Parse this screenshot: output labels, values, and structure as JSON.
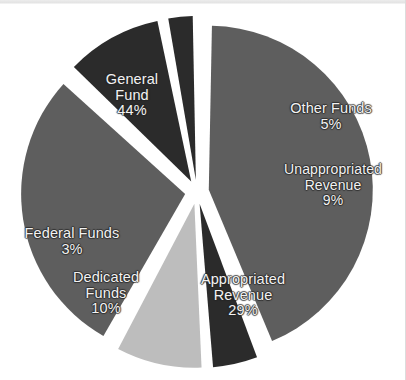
{
  "figure": {
    "kind": "pie-chart",
    "background_color": "#ffffff"
  },
  "chart_data": {
    "type": "pie",
    "title": "",
    "xlabel": "",
    "ylabel": "",
    "grid": false,
    "legend_position": "none",
    "label_style": "inside-slice",
    "exploded": true,
    "total_percent": 100,
    "categories": [
      "General Fund",
      "Other Funds",
      "Unappropriated Revenue",
      "Appropriated Revenue",
      "Dedicated Funds",
      "Federal Funds"
    ],
    "values": [
      44,
      5,
      9,
      29,
      10,
      3
    ],
    "slices": [
      {
        "name": "General Fund",
        "label_line1": "General",
        "label_line2": "Fund",
        "percent_label": "44%",
        "value": 44,
        "color": "#5e5e5e"
      },
      {
        "name": "Other Funds",
        "label_line1": "Other Funds",
        "label_line2": "",
        "percent_label": "5%",
        "value": 5,
        "color": "#2b2b2b"
      },
      {
        "name": "Unappropriated Revenue",
        "label_line1": "Unappropriated",
        "label_line2": "Revenue",
        "percent_label": "9%",
        "value": 9,
        "color": "#bdbdbd"
      },
      {
        "name": "Appropriated Revenue",
        "label_line1": "Appropriated",
        "label_line2": "Revenue",
        "percent_label": "29%",
        "value": 29,
        "color": "#5e5e5e"
      },
      {
        "name": "Dedicated Funds",
        "label_line1": "Dedicated",
        "label_line2": "Funds",
        "percent_label": "10%",
        "value": 10,
        "color": "#2b2b2b"
      },
      {
        "name": "Federal Funds",
        "label_line1": "Federal Funds",
        "label_line2": "",
        "percent_label": "3%",
        "value": 3,
        "color": "#2b2b2b"
      }
    ]
  }
}
